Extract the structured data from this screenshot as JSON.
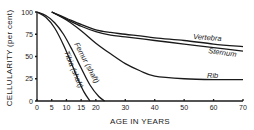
{
  "chart_data": {
    "type": "line",
    "title": "",
    "xlabel": "AGE IN YEARS",
    "ylabel": "CELLULARITY (per cent)",
    "xlim": [
      0,
      70
    ],
    "ylim": [
      0,
      100
    ],
    "grid": false,
    "legend": "inline labels",
    "x_ticks": [
      0,
      5,
      10,
      15,
      20,
      30,
      40,
      50,
      60,
      70
    ],
    "y_ticks": [
      0,
      25,
      50,
      75,
      100
    ],
    "series": [
      {
        "name": "Vertebra",
        "x": [
          5,
          10,
          15,
          20,
          25,
          30,
          40,
          50,
          60,
          70
        ],
        "values": [
          100,
          93,
          86,
          80,
          77,
          75,
          71,
          68,
          64,
          61
        ]
      },
      {
        "name": "Sternum",
        "x": [
          5,
          10,
          15,
          20,
          25,
          30,
          40,
          50,
          60,
          70
        ],
        "values": [
          100,
          92,
          84,
          78,
          74,
          72,
          68,
          64,
          60,
          56
        ]
      },
      {
        "name": "Rib",
        "x": [
          5,
          10,
          15,
          20,
          25,
          30,
          35,
          40,
          50,
          60,
          70
        ],
        "values": [
          100,
          91,
          79,
          65,
          53,
          42,
          34,
          28,
          25,
          24,
          24
        ]
      },
      {
        "name": "Femur (shaft)",
        "x": [
          0,
          3,
          6,
          9,
          12,
          15,
          18,
          21,
          23
        ],
        "values": [
          100,
          96,
          88,
          75,
          57,
          37,
          18,
          5,
          0
        ]
      },
      {
        "name": "Tibia (shaft)",
        "x": [
          0,
          3,
          6,
          9,
          12,
          14,
          16,
          18
        ],
        "values": [
          100,
          94,
          82,
          63,
          40,
          24,
          10,
          0
        ]
      }
    ]
  },
  "labels": {
    "y_axis_title": "CELLULARITY (per cent)",
    "x_axis_title": "AGE IN YEARS",
    "vertebra": "Vertebra",
    "sternum": "Sternum",
    "rib": "Rib",
    "femur": "Femur (shaft)",
    "tibia": "Tibia (shaft)"
  }
}
